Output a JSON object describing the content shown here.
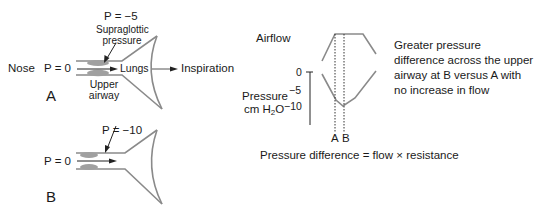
{
  "panel_a": {
    "nose_label": "Nose",
    "nose_pressure": "P = 0",
    "supraglottic_pressure_value": "P = −5",
    "supraglottic_label_line1": "Supraglottic",
    "supraglottic_label_line2": "pressure",
    "lungs_label": "Lungs",
    "upper_airway_line1": "Upper",
    "upper_airway_line2": "airway",
    "inspiration_label": "Inspiration",
    "panel_letter": "A"
  },
  "panel_b": {
    "nose_pressure": "P = 0",
    "supraglottic_pressure_value": "P = −10",
    "panel_letter": "B"
  },
  "graph": {
    "airflow_label": "Airflow",
    "pressure_label_line1": "Pressure",
    "pressure_label_unit_pre": "cm H",
    "pressure_label_unit_sub": "2",
    "pressure_label_unit_post": "O",
    "y_ticks": [
      "0",
      "−5",
      "−10"
    ],
    "marker_a": "A",
    "marker_b": "B",
    "annotation": "Greater pressure difference across the upper airway at B versus A with no increase in flow",
    "equation": "Pressure difference = flow × resistance"
  },
  "colors": {
    "line": "#8a8a8a",
    "tissue": "#9a9a9a",
    "text": "#1a1a1a"
  }
}
